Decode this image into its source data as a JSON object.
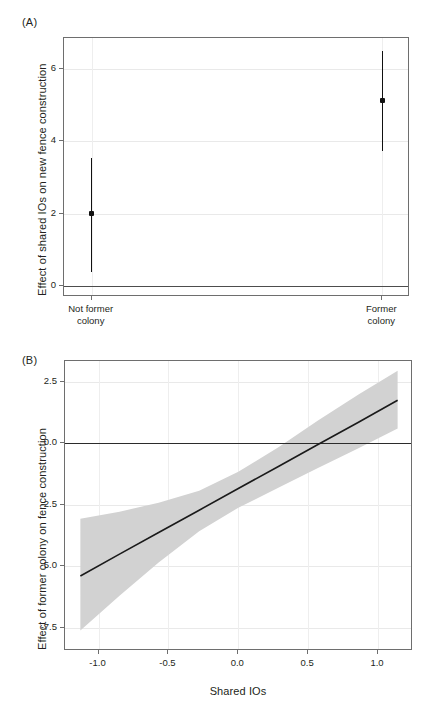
{
  "figure": {
    "panel_a_letter": "(A)",
    "panel_b_letter": "(B)"
  },
  "chart_data": [
    {
      "id": "panel-a",
      "type": "scatter",
      "title": "(A)",
      "xlabel": "",
      "ylabel": "Effect of shared IOs on new fence construction",
      "categories": [
        "Not former colony",
        "Former colony"
      ],
      "category_lines": [
        [
          "Not former",
          "colony"
        ],
        [
          "Former",
          "colony"
        ]
      ],
      "values": [
        2.0,
        5.12
      ],
      "ci_low": [
        0.4,
        3.72
      ],
      "ci_high": [
        3.55,
        6.5
      ],
      "yticks": [
        0,
        2,
        4,
        6
      ],
      "ytick_labels": [
        "0",
        "2",
        "4",
        "6"
      ],
      "ylim": [
        -0.3,
        6.85
      ],
      "xlim": [
        0,
        1
      ],
      "x_positions": [
        0.08,
        0.92
      ],
      "grid": true,
      "reference_line": 0,
      "legend": "none",
      "marker_color": "#111111",
      "error_color": "#111111"
    },
    {
      "id": "panel-b",
      "type": "line",
      "title": "(B)",
      "xlabel": "Shared IOs",
      "ylabel": "Effect of former colony on fence construction",
      "yticks": [
        2.5,
        0.0,
        -2.5,
        -5.0,
        -7.5
      ],
      "ytick_labels": [
        "2.5",
        "0.0",
        "-2.5",
        "-5.0",
        "-7.5"
      ],
      "xticks": [
        -1.0,
        -0.5,
        0.0,
        0.5,
        1.0
      ],
      "xtick_labels": [
        "-1.0",
        "-0.5",
        "0.0",
        "0.5",
        "1.0"
      ],
      "ylim": [
        -8.45,
        3.35
      ],
      "xlim": [
        -1.24,
        1.25
      ],
      "grid": true,
      "reference_line": 0.0,
      "legend": "none",
      "line_color": "#1a1a1a",
      "band_color": "#d2d2d2",
      "x": [
        -1.13,
        -0.85,
        -0.57,
        -0.28,
        0.0,
        0.29,
        0.57,
        0.86,
        1.14
      ],
      "fit": [
        -5.4,
        -4.51,
        -3.63,
        -2.72,
        -1.84,
        -0.93,
        -0.05,
        0.86,
        1.75
      ],
      "band_low": [
        -7.62,
        -6.2,
        -4.85,
        -3.58,
        -2.62,
        -1.8,
        -1.0,
        -0.2,
        0.6
      ],
      "band_high": [
        -3.07,
        -2.78,
        -2.42,
        -1.93,
        -1.16,
        -0.15,
        0.93,
        1.99,
        2.95
      ],
      "zero_crossing": 0.58
    }
  ]
}
